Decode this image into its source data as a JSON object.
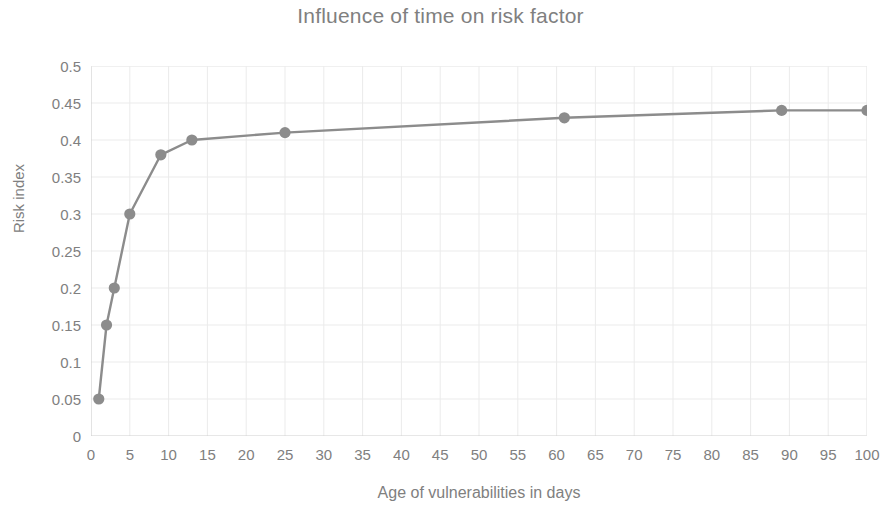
{
  "chart_data": {
    "type": "line",
    "title": "Influence of time on risk factor",
    "xlabel": "Age of vulnerabilities in days",
    "ylabel": "Risk index",
    "x": [
      1,
      2,
      3,
      5,
      9,
      13,
      25,
      61,
      89,
      100
    ],
    "values": [
      0.05,
      0.15,
      0.2,
      0.3,
      0.38,
      0.4,
      0.41,
      0.43,
      0.44,
      0.44
    ],
    "series": [
      {
        "name": "Risk index",
        "x": [
          1,
          2,
          3,
          5,
          9,
          13,
          25,
          61,
          89,
          100
        ],
        "values": [
          0.05,
          0.15,
          0.2,
          0.3,
          0.38,
          0.4,
          0.41,
          0.43,
          0.44,
          0.44
        ]
      }
    ],
    "xlim": [
      0,
      100
    ],
    "ylim": [
      0,
      0.5
    ],
    "xticks": [
      0,
      5,
      10,
      15,
      20,
      25,
      30,
      35,
      40,
      45,
      50,
      55,
      60,
      65,
      70,
      75,
      80,
      85,
      90,
      95,
      100
    ],
    "xtick_labels": [
      "0",
      "5",
      "10",
      "15",
      "20",
      "25",
      "30",
      "35",
      "40",
      "45",
      "50",
      "55",
      "60",
      "65",
      "70",
      "75",
      "80",
      "85",
      "90",
      "95",
      "100"
    ],
    "yticks": [
      0,
      0.05,
      0.1,
      0.15,
      0.2,
      0.25,
      0.3,
      0.35,
      0.4,
      0.45,
      0.5
    ],
    "ytick_labels": [
      "0",
      "0.05",
      "0.1",
      "0.15",
      "0.2",
      "0.25",
      "0.3",
      "0.35",
      "0.4",
      "0.45",
      "0.5"
    ],
    "grid": true,
    "grid_x": true,
    "grid_y": true,
    "legend": false,
    "legend_position": "none",
    "marker": "circle",
    "line_color": "#8c8c8c",
    "marker_color": "#8c8c8c",
    "grid_color": "#ebebeb",
    "axis_color": "#d0d0d0",
    "text_color": "#808080",
    "background": "#ffffff"
  }
}
